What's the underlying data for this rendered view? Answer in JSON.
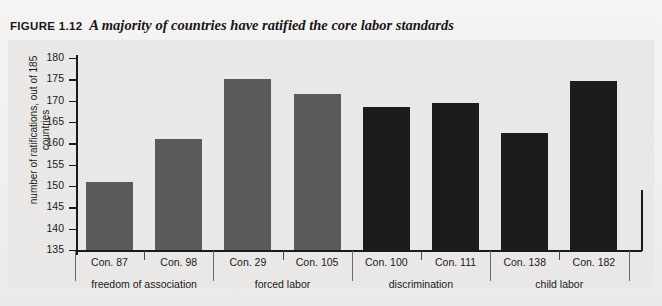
{
  "figure": {
    "label": "FIGURE 1.12",
    "title": "A majority of countries have ratified the core labor standards"
  },
  "chart_data": {
    "type": "bar",
    "title": "A majority of countries have ratified the core labor standards",
    "xlabel": "",
    "ylabel": "number of ratifications, out of 185 countries",
    "ylim": [
      135,
      180
    ],
    "yticks": [
      135,
      140,
      145,
      150,
      155,
      160,
      165,
      170,
      175,
      180
    ],
    "grid": false,
    "legend": "none",
    "categories": [
      "Con. 87",
      "Con. 98",
      "Con. 29",
      "Con. 105",
      "Con. 100",
      "Con. 111",
      "Con. 138",
      "Con. 182"
    ],
    "values": [
      151,
      161,
      175,
      171.5,
      168.5,
      169.5,
      162.5,
      174.5
    ],
    "bar_colors": [
      "#5a5a5a",
      "#5a5a5a",
      "#5a5a5a",
      "#5a5a5a",
      "#1c1c1c",
      "#1c1c1c",
      "#1c1c1c",
      "#1c1c1c"
    ],
    "groups": [
      {
        "label": "freedom of association",
        "categories": [
          "Con. 87",
          "Con. 98"
        ]
      },
      {
        "label": "forced labor",
        "categories": [
          "Con. 29",
          "Con. 105"
        ]
      },
      {
        "label": "discrimination",
        "categories": [
          "Con. 100",
          "Con. 111"
        ]
      },
      {
        "label": "child labor",
        "categories": [
          "Con. 138",
          "Con. 182"
        ]
      }
    ]
  },
  "colors": {
    "page_background": "#f2f2f0",
    "panel_background": "#e9e8e6",
    "axis": "#1a1a1a",
    "bar_light": "#5a5a5a",
    "bar_dark": "#1c1c1c",
    "text": "#1a191d"
  }
}
